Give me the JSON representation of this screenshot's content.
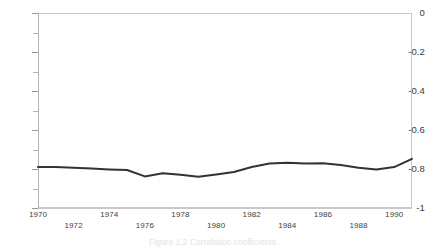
{
  "chart_data": {
    "type": "line",
    "title": "",
    "xlabel": "",
    "ylabel": "",
    "xlim": [
      1970,
      1991
    ],
    "ylim": [
      -1,
      0
    ],
    "grid": false,
    "legend": null,
    "line_color": "#333333",
    "axis_color": "#c9c9c9",
    "background": "#ffffff",
    "y_ticks": [
      0,
      -0.1,
      -0.2,
      -0.3,
      -0.4,
      -0.5,
      -0.6,
      -0.7,
      -0.8,
      -0.9,
      -1
    ],
    "y_tick_labels": [
      "0",
      "-0.2",
      "-0.4",
      "-0.6",
      "-0.8",
      "-1"
    ],
    "y_labeled_values": [
      0,
      -0.2,
      -0.4,
      -0.6,
      -0.8,
      -1
    ],
    "x_tick_labels_top": [
      "1970",
      "1974",
      "1978",
      "1982",
      "1986",
      "1990"
    ],
    "x_tick_labels_bottom": [
      "1972",
      "1976",
      "1980",
      "1984",
      "1988"
    ],
    "x_top_values": [
      1970,
      1974,
      1978,
      1982,
      1986,
      1990
    ],
    "x_bottom_values": [
      1972,
      1976,
      1980,
      1984,
      1988
    ],
    "x": [
      1970,
      1971,
      1972,
      1973,
      1974,
      1975,
      1976,
      1977,
      1978,
      1979,
      1980,
      1981,
      1982,
      1983,
      1984,
      1985,
      1986,
      1987,
      1988,
      1989,
      1990,
      1991
    ],
    "values": [
      -0.79,
      -0.79,
      -0.793,
      -0.798,
      -0.802,
      -0.805,
      -0.838,
      -0.822,
      -0.83,
      -0.84,
      -0.828,
      -0.815,
      -0.79,
      -0.772,
      -0.768,
      -0.772,
      -0.77,
      -0.78,
      -0.793,
      -0.802,
      -0.79,
      -0.748
    ],
    "series": [
      {
        "name": "series-1",
        "values": [
          -0.79,
          -0.79,
          -0.793,
          -0.798,
          -0.802,
          -0.805,
          -0.838,
          -0.822,
          -0.83,
          -0.84,
          -0.828,
          -0.815,
          -0.79,
          -0.772,
          -0.768,
          -0.772,
          -0.77,
          -0.78,
          -0.793,
          -0.802,
          -0.79,
          -0.748
        ]
      }
    ],
    "annotations": []
  },
  "caption": {
    "text": "Figure 1.2   Correlation coefficients"
  }
}
